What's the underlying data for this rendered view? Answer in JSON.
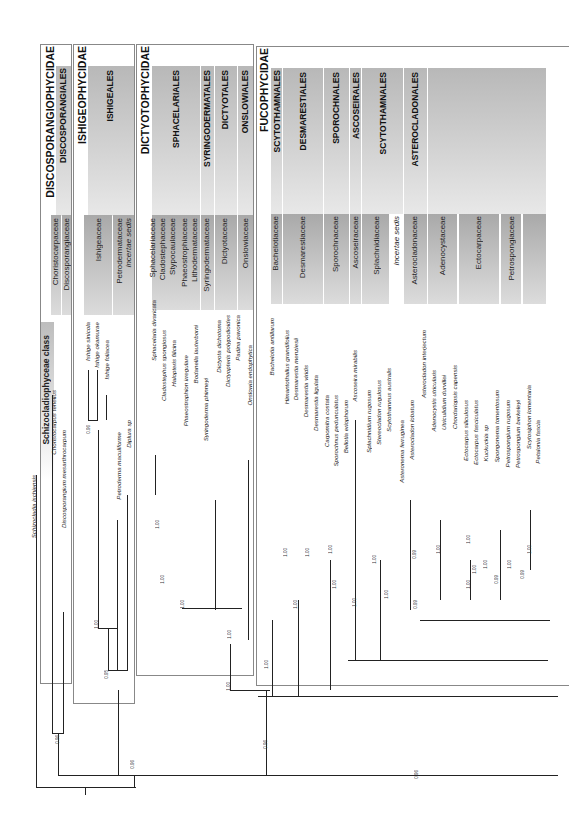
{
  "figure": {
    "class_label": "Schizocladiophyceae class",
    "outgroup": "Schizocladia ischiensis"
  },
  "subclasses": [
    {
      "name": "DISCOSPORANGIOPHYCIDAE"
    },
    {
      "name": "ISHIGEOPHYCIDAE"
    },
    {
      "name": "DICTYOTOPHYCIDAE"
    },
    {
      "name": "FUCOPHYCIDAE"
    }
  ],
  "orders": [
    {
      "name": "DISCOSPORANGIALES"
    },
    {
      "name": "ISHIGEALES"
    },
    {
      "name": "SPHACELARIALES"
    },
    {
      "name": "SYRINGODERMATALES"
    },
    {
      "name": "DICTYOTALES"
    },
    {
      "name": "ONSLOWIALES"
    },
    {
      "name": "SCYTOTHAMNALES"
    },
    {
      "name": "DESMARESTIALES"
    },
    {
      "name": "SPOROCHNALES"
    },
    {
      "name": "ASCOSEIRALES"
    },
    {
      "name": "SCYTOTHAMNALES"
    },
    {
      "name": "ASTEROCLADONALES"
    }
  ],
  "families": [
    {
      "name": "Choristocarpaceae"
    },
    {
      "name": "Discosporangiaceae"
    },
    {
      "name": "Ishigeaceae"
    },
    {
      "name": "Petrodermataceae"
    },
    {
      "name": "incertae sedis"
    },
    {
      "name": "Sphacelariaceae"
    },
    {
      "name": "Cladostephaceae"
    },
    {
      "name": "Stypocaulaceae"
    },
    {
      "name": "Phaeostrophiaceae"
    },
    {
      "name": "Lithodermataceae"
    },
    {
      "name": "Syringodermataceae"
    },
    {
      "name": "Dictyotaceae"
    },
    {
      "name": "Onslowiaceae"
    },
    {
      "name": "Bachelotiaceae"
    },
    {
      "name": "Desmarestiaceae"
    },
    {
      "name": "Sporochnaceae"
    },
    {
      "name": "Ascoseiraceae"
    },
    {
      "name": "Splachnidiaceae"
    },
    {
      "name": "incertae sedis"
    },
    {
      "name": "Asterocladonaceae"
    },
    {
      "name": "Adenocystaceae"
    },
    {
      "name": "Ectocarpaceae"
    },
    {
      "name": "Petrospongiaceae"
    }
  ],
  "taxa": [
    "Schizocladia ischiensis",
    "Choristocarpus tenellus",
    "Discosporangium mesarthrocarpum",
    "Ishige sinicola",
    "Ishige okamurae",
    "Ishige foliacea",
    "Petroderma maculiforme",
    "Diplura sp",
    "Sphacelaria divaricata",
    "Cladostephus spongiosus",
    "Halopteris filicina",
    "Phaeostrophion irregulare",
    "Bodanella lauterborni",
    "Syringoderma phinneyi",
    "Dictyota dichotoma",
    "Dictyopteris polypodioides",
    "Padina pavonica",
    "Onslowia endophytica",
    "Bachelotia antillarum",
    "Himantothallus grandifolius",
    "Desmarestia menziesii",
    "Desmarestia viridis",
    "Desmarestia ligulata",
    "Carpomitra costata",
    "Sporochnus pedunculatus",
    "Bellotia eriophorum",
    "Ascoseira mirabilis",
    "Splachnidium rugosum",
    "Stereocladon rugulosus",
    "Scytothamnus australis",
    "Asteronema ferruginea",
    "Asterocladon lobatum",
    "Asterocladon interjectum",
    "Adenocystis utricularis",
    "Utriculidium durvillei",
    "Chordariopsis capensis",
    "Ectocarpus siliculosus",
    "Ectocarpus fasciculatus",
    "Kuckuckia sp",
    "Spongonema tomentosum",
    "Petrospongium rugosum",
    "Petrospongium berkeleyi",
    "Scytosiphon lomentaria",
    "Petalonia fascia"
  ],
  "support_values": [
    "0.96",
    "0.96",
    "0.95",
    "1.00",
    "0.96",
    "1.00",
    "1.00",
    "1.00",
    "1.00",
    "1.00",
    "1.00",
    "0.96",
    "1.00",
    "1.00",
    "1.00",
    "1.00",
    "1.00",
    "1.00",
    "1.00",
    "1.00",
    "0.99",
    "0.99",
    "1.00",
    "1.00",
    "1.00",
    "1.00",
    "1.00",
    "1.00",
    "0.99",
    "0.99",
    "0.96",
    "1.00"
  ]
}
